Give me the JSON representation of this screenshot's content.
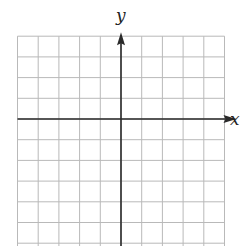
{
  "chart_data": {
    "type": "coordinate-grid",
    "title": "",
    "xlabel": "x",
    "ylabel": "y",
    "grid": true,
    "columns_left_of_y_axis": 5,
    "columns_right_of_y_axis": 5,
    "rows_above_x_axis": 4,
    "rows_below_x_axis_visible": 6,
    "x_axis_arrow": "right",
    "y_axis_arrow": "up",
    "colors": {
      "grid": "#b9b9b9",
      "axis": "#2a2a2a",
      "label": "#222222"
    }
  }
}
